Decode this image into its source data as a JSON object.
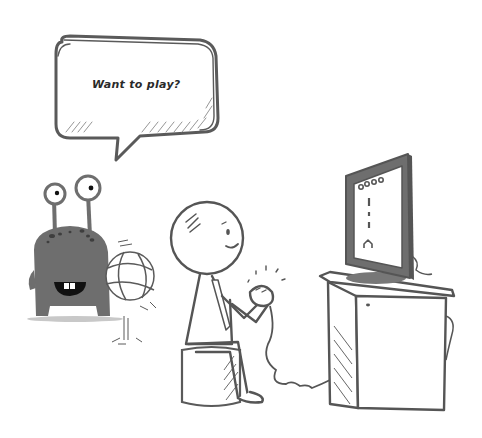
{
  "scene": {
    "description": "Cartoon illustration of a monster holding a basketball asking a boy playing video games if he wants to play",
    "colors": {
      "background": "#ffffff",
      "line": "#555555",
      "monster_body": "#6e6e6e",
      "monster_spots": "#3e3e3e",
      "shadow": "#c8c8c8"
    }
  },
  "speech_bubble": {
    "text": "Want to play?"
  },
  "characters": [
    {
      "name": "monster",
      "holding": "basketball"
    },
    {
      "name": "boy",
      "holding": "game controller",
      "seated_on": "stool"
    }
  ],
  "objects": [
    "television",
    "tv-cabinet",
    "controller-cable"
  ]
}
